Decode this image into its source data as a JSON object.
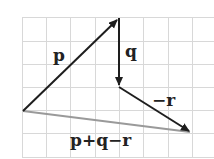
{
  "diagram": {
    "type": "vector-addition",
    "grid": {
      "x0": 22,
      "y0": 17,
      "spacing": 24,
      "cols": 8,
      "rows": 6,
      "color": "#d8d8d8"
    },
    "colors": {
      "vector": "#1e1e1e",
      "result": "#9a9a9a",
      "label": "#222222"
    },
    "points": {
      "origin": [
        23,
        111
      ],
      "p_tip": [
        119,
        18
      ],
      "q_tip": [
        119,
        87
      ],
      "r_tip": [
        191,
        132
      ]
    },
    "vectors": [
      {
        "id": "p",
        "label": "p"
      },
      {
        "id": "q",
        "label": "q"
      },
      {
        "id": "neg-r",
        "label": "−r"
      },
      {
        "id": "sum",
        "label": "p+q−r"
      }
    ]
  }
}
